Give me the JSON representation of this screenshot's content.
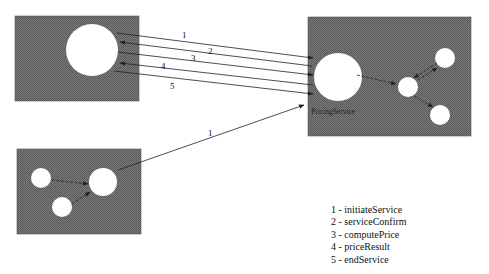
{
  "diagram": {
    "colors": {
      "box_fill": "#6e6e6e",
      "circle_fill": "#ffffff",
      "line": "#222222"
    },
    "nodes": {
      "client": {
        "label": ""
      },
      "pricing_service": {
        "label": "PricingService"
      },
      "other_client": {
        "label": ""
      }
    },
    "messages": [
      {
        "number": "1",
        "from": "client",
        "to": "pricing_service"
      },
      {
        "number": "2",
        "from": "pricing_service",
        "to": "client"
      },
      {
        "number": "3",
        "from": "client",
        "to": "pricing_service"
      },
      {
        "number": "4",
        "from": "pricing_service",
        "to": "client"
      },
      {
        "number": "5",
        "from": "client",
        "to": "pricing_service"
      },
      {
        "number": "1",
        "from": "other_client",
        "to": "pricing_service"
      }
    ],
    "legend": [
      "1 - initiateService",
      "2 - serviceConfirm",
      "3 - computePrice",
      "4 - priceResult",
      "5 - endService"
    ]
  }
}
